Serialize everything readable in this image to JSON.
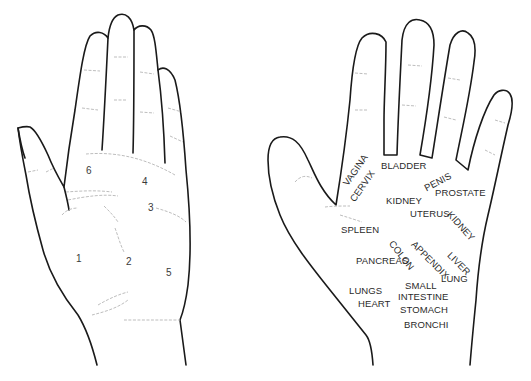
{
  "diagram": {
    "type": "reflexology-hand-map",
    "left_hand": {
      "description": "palm view with numbered zones",
      "zones": [
        {
          "label": "1",
          "x": 76,
          "y": 259
        },
        {
          "label": "2",
          "x": 125,
          "y": 257
        },
        {
          "label": "3",
          "x": 148,
          "y": 204
        },
        {
          "label": "4",
          "x": 142,
          "y": 178
        },
        {
          "label": "5",
          "x": 166,
          "y": 268
        },
        {
          "label": "6",
          "x": 86,
          "y": 166
        }
      ]
    },
    "right_hand": {
      "description": "palm view with organ reflex labels",
      "labels": [
        {
          "text": "VAGINA",
          "x": 345,
          "y": 180,
          "rotate": -55
        },
        {
          "text": "CERVIX",
          "x": 352,
          "y": 196,
          "rotate": -55
        },
        {
          "text": "BLADDER",
          "x": 380,
          "y": 161,
          "rotate": 0
        },
        {
          "text": "PENIS",
          "x": 425,
          "y": 180,
          "rotate": -28
        },
        {
          "text": "PROSTATE",
          "x": 435,
          "y": 187,
          "rotate": 0
        },
        {
          "text": "KIDNEY",
          "x": 386,
          "y": 195,
          "rotate": 0
        },
        {
          "text": "UTERUS",
          "x": 410,
          "y": 209,
          "rotate": 0
        },
        {
          "text": "KIDNEY",
          "x": 448,
          "y": 212,
          "rotate": 48
        },
        {
          "text": "SPLEEN",
          "x": 341,
          "y": 224,
          "rotate": 0
        },
        {
          "text": "COLON",
          "x": 390,
          "y": 240,
          "rotate": 52
        },
        {
          "text": "APPENDIX",
          "x": 412,
          "y": 240,
          "rotate": 45
        },
        {
          "text": "LIVER",
          "x": 448,
          "y": 252,
          "rotate": 45
        },
        {
          "text": "PANCREAS",
          "x": 356,
          "y": 256,
          "rotate": 0
        },
        {
          "text": "LUNG",
          "x": 441,
          "y": 274,
          "rotate": 0
        },
        {
          "text": "SMALL",
          "x": 405,
          "y": 281,
          "rotate": 0
        },
        {
          "text": "LUNGS",
          "x": 349,
          "y": 286,
          "rotate": 0
        },
        {
          "text": "INTESTINE",
          "x": 398,
          "y": 292,
          "rotate": 0
        },
        {
          "text": "HEART",
          "x": 358,
          "y": 299,
          "rotate": 0
        },
        {
          "text": "STOMACH",
          "x": 400,
          "y": 305,
          "rotate": 0
        },
        {
          "text": "BRONCHI",
          "x": 404,
          "y": 320,
          "rotate": 0
        }
      ]
    },
    "colors": {
      "background": "#ffffff",
      "outline": "#1a1a1a",
      "crease": "#b5b5b5",
      "text": "#2a2a2a"
    }
  }
}
